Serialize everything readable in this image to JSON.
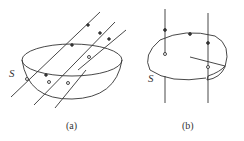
{
  "figures": [
    {
      "id": "a",
      "caption": "(a)",
      "surface_label": "S",
      "description": "hemispherical surface S with field lines passing through"
    },
    {
      "id": "b",
      "caption": "(b)",
      "surface_label": "S",
      "description": "open surface S bounded by closed loop with field lines passing through"
    }
  ],
  "colors": {
    "stroke": "#333333",
    "background": "#ffffff"
  }
}
